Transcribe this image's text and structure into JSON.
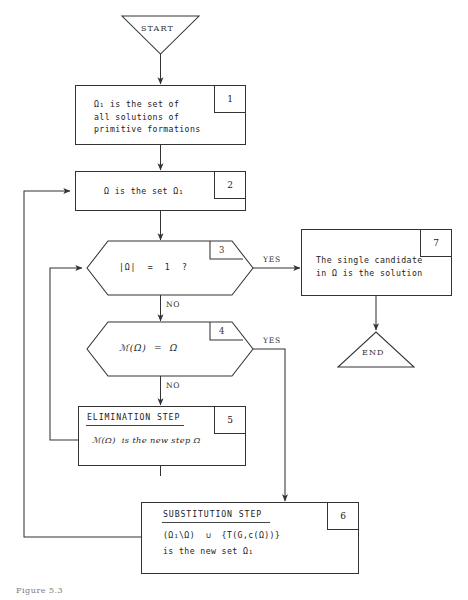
{
  "diagram": {
    "caption": "Figure 5.3",
    "line_color": "#333333",
    "text_color": "#222222",
    "background": "#ffffff"
  },
  "terminators": {
    "start": {
      "label": "START",
      "shape": "inverted-triangle"
    },
    "end": {
      "label": "END",
      "shape": "triangle"
    }
  },
  "edge_labels": {
    "yes_1": "YES",
    "yes_2": "YES",
    "no_1": "NO",
    "no_2": "NO"
  },
  "nodes": [
    {
      "id": "box1",
      "number": "1",
      "type": "process",
      "lines": [
        "Ω₁ is the set of",
        "all solutions of",
        "primitive formations"
      ]
    },
    {
      "id": "box2",
      "number": "2",
      "type": "process",
      "lines": [
        "Ω is the set Ω₁"
      ]
    },
    {
      "id": "dec3",
      "number": "3",
      "type": "decision",
      "lines": [
        "|Ω|  =  1  ?"
      ]
    },
    {
      "id": "dec4",
      "number": "4",
      "type": "decision",
      "lines": [
        "ℳ(Ω)  =  Ω"
      ]
    },
    {
      "id": "box5",
      "number": "5",
      "type": "process",
      "header": "ELIMINATION STEP",
      "lines": [
        "ℳ(Ω)  is the new step Ω"
      ]
    },
    {
      "id": "box6",
      "number": "6",
      "type": "process",
      "header": "SUBSTITUTION STEP",
      "lines": [
        "(Ω₁\\Ω)  ∪  {T(G,c(Ω))}",
        "is the new set Ω₁"
      ]
    },
    {
      "id": "box7",
      "number": "7",
      "type": "process",
      "lines": [
        "The single candidate",
        "in Ω is the solution"
      ]
    }
  ]
}
